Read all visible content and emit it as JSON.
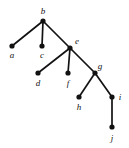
{
  "figure": {
    "type": "tree-diagram",
    "width": 129,
    "height": 148,
    "background_color": "#ffffff",
    "node_color": "#121212",
    "edge_color": "#121212",
    "label_style": "italic serif"
  },
  "chart_data": {
    "type": "diagram",
    "title": "",
    "root": "b",
    "nodes": [
      {
        "id": "a",
        "label": "a",
        "x": 12,
        "y": 46,
        "label_x": 12,
        "label_y": 58
      },
      {
        "id": "b",
        "label": "b",
        "x": 43,
        "y": 21,
        "label_x": 43,
        "label_y": 14
      },
      {
        "id": "c",
        "label": "c",
        "x": 42,
        "y": 46,
        "label_x": 42,
        "label_y": 58
      },
      {
        "id": "d",
        "label": "d",
        "x": 38,
        "y": 73,
        "label_x": 38,
        "label_y": 86
      },
      {
        "id": "e",
        "label": "e",
        "x": 70,
        "y": 48,
        "label_x": 77,
        "label_y": 44
      },
      {
        "id": "f",
        "label": "f",
        "x": 68,
        "y": 73,
        "label_x": 68,
        "label_y": 86
      },
      {
        "id": "g",
        "label": "g",
        "x": 95,
        "y": 73,
        "label_x": 100,
        "label_y": 69
      },
      {
        "id": "h",
        "label": "h",
        "x": 79,
        "y": 97,
        "label_x": 79,
        "label_y": 110
      },
      {
        "id": "i",
        "label": "i",
        "x": 112,
        "y": 97,
        "label_x": 120,
        "label_y": 100
      },
      {
        "id": "j",
        "label": "j",
        "x": 112,
        "y": 127,
        "label_x": 112,
        "label_y": 141
      }
    ],
    "edges": [
      {
        "from": "b",
        "to": "a"
      },
      {
        "from": "b",
        "to": "c"
      },
      {
        "from": "b",
        "to": "e"
      },
      {
        "from": "e",
        "to": "d"
      },
      {
        "from": "e",
        "to": "f"
      },
      {
        "from": "e",
        "to": "g"
      },
      {
        "from": "g",
        "to": "h"
      },
      {
        "from": "g",
        "to": "i"
      },
      {
        "from": "i",
        "to": "j"
      }
    ],
    "node_radius": 2.6
  }
}
